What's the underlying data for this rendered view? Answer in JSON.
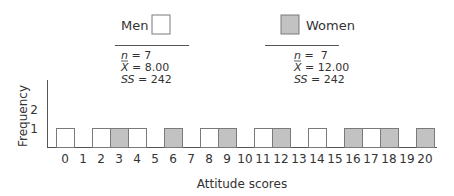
{
  "chart_data": {
    "type": "bar",
    "title": "",
    "xlabel": "Attitude scores",
    "ylabel": "Frequency",
    "x_ticks": [
      "0",
      "1",
      "2",
      "3",
      "4",
      "5",
      "6",
      "7",
      "8",
      "9",
      "10",
      "11",
      "12",
      "13",
      "14",
      "15",
      "16",
      "17",
      "18",
      "19",
      "20"
    ],
    "y_ticks": [
      "1",
      "2"
    ],
    "xlim": [
      0,
      20
    ],
    "ylim": [
      0,
      3
    ],
    "grid": false,
    "legend_placement": "top",
    "series": [
      {
        "name": "Men",
        "color": "#ffffff",
        "scores": [
          0,
          2,
          4,
          8,
          11,
          14,
          17
        ],
        "frequency": 1,
        "stats": {
          "n_label": "n",
          "n": "= 7",
          "mean_label": "X",
          "mean": "= 8.00",
          "ss_label": "SS",
          "ss": "= 242"
        }
      },
      {
        "name": "Women",
        "color": "#c2c2c2",
        "scores": [
          3,
          6,
          9,
          12,
          16,
          18,
          20
        ],
        "frequency": 1,
        "stats": {
          "n_label": "n",
          "n": "=  7",
          "mean_label": "X",
          "mean": "= 12.00",
          "ss_label": "SS",
          "ss": "= 242"
        }
      }
    ]
  },
  "colors": {
    "axis": "#555555",
    "bar_border": "#7a7a7a",
    "gray_fill": "#c2c2c2"
  }
}
